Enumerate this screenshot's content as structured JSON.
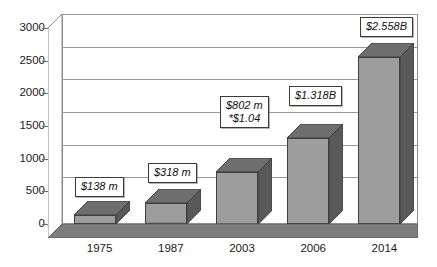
{
  "chart_data": {
    "type": "bar",
    "title": "",
    "subtitle": "",
    "xlabel": "",
    "ylabel": "",
    "categories": [
      "1975",
      "1987",
      "2003",
      "2006",
      "2014"
    ],
    "values": [
      138,
      318,
      802,
      1318,
      2558
    ],
    "ylim": [
      0,
      3000
    ],
    "yticks": [
      "0",
      "500",
      "1000",
      "1500",
      "2000",
      "2500",
      "3000"
    ],
    "ytick_values": [
      0,
      500,
      1000,
      1500,
      2000,
      2500,
      3000
    ],
    "grid": true,
    "legend": "none",
    "style": "3d-column",
    "annotations": [
      {
        "category": "1975",
        "line1": "$138 m",
        "line2": ""
      },
      {
        "category": "1987",
        "line1": "$318 m",
        "line2": ""
      },
      {
        "category": "2003",
        "line1": "$802 m",
        "line2": "*$1.04"
      },
      {
        "category": "2006",
        "line1": "$1.318B",
        "line2": ""
      },
      {
        "category": "2014",
        "line1": "$2.558B",
        "line2": ""
      }
    ],
    "colors": {
      "bar_front": "#9d9d9d",
      "bar_side": "#595959",
      "bar_top": "#6e6e6e",
      "floor": "#7d7d7d",
      "wall": "#ffffff",
      "gridline": "#9a9a9a",
      "axis": "#6f6f6f",
      "text": "#1a1a1a"
    }
  }
}
